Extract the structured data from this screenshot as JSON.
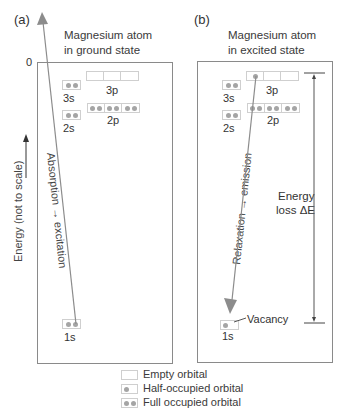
{
  "panels": [
    {
      "id": "a",
      "label": "(a)",
      "title_line1": "Magnesium atom",
      "title_line2": "in ground state",
      "zero_label": "0",
      "orbitals": {
        "s3": "3s",
        "p3": "3p",
        "s2": "2s",
        "p2": "2p",
        "s1": "1s"
      },
      "arrow_label": "Absorption → excitation"
    },
    {
      "id": "b",
      "label": "(b)",
      "title_line1": "Magnesium atom",
      "title_line2": "in excited state",
      "orbitals": {
        "s3": "3s",
        "p3": "3p",
        "s2": "2s",
        "p2": "2p",
        "s1": "1s"
      },
      "arrow_label": "Relaxation → emission",
      "vacancy_label": "Vacancy",
      "energy_loss_line1": "Energy",
      "energy_loss_line2": "loss ΔE"
    }
  ],
  "y_axis_label": "Energy (not to scale)",
  "legend": {
    "empty": "Empty orbital",
    "half": "Half-occupied orbital",
    "full": "Full occupied orbital"
  },
  "colors": {
    "frame": "#8a8a8a",
    "electron": "#a5a5a5",
    "arrow": "#8c8c8c",
    "orbital_border": "#cfcfcf"
  }
}
